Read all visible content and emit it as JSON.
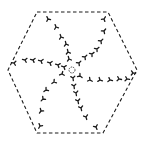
{
  "diagram": {
    "title": "",
    "shape": "hexagon-dashed-outline",
    "hexagon_points": [
      [
        37,
        12
      ],
      [
        108,
        12
      ],
      [
        137,
        70
      ],
      [
        103,
        133
      ],
      [
        37,
        133
      ],
      [
        8,
        70
      ]
    ],
    "stroke_color": "#1a1a1a",
    "background": "#ffffff",
    "center": {
      "x": 72,
      "y": 70,
      "r": 3,
      "icon": "circle-icon"
    },
    "arms": [
      {
        "name": "arm-upper-left",
        "marks": [
          [
            48,
            19
          ],
          [
            56,
            27
          ],
          [
            61,
            37
          ],
          [
            66,
            44
          ],
          [
            68,
            52
          ],
          [
            69,
            59
          ]
        ]
      },
      {
        "name": "arm-upper-right",
        "marks": [
          [
            104,
            19
          ],
          [
            104,
            31
          ],
          [
            101,
            41
          ],
          [
            97,
            49
          ],
          [
            92,
            54
          ],
          [
            85,
            57
          ],
          [
            79,
            63
          ]
        ]
      },
      {
        "name": "arm-left",
        "marks": [
          [
            14,
            63
          ],
          [
            25,
            60
          ],
          [
            33,
            60
          ],
          [
            41,
            61
          ],
          [
            50,
            63
          ],
          [
            58,
            65
          ],
          [
            64,
            67
          ]
        ]
      },
      {
        "name": "arm-right",
        "marks": [
          [
            80,
            76
          ],
          [
            90,
            80
          ],
          [
            100,
            80
          ],
          [
            110,
            80
          ],
          [
            119,
            79
          ],
          [
            127,
            79
          ],
          [
            133,
            73
          ]
        ]
      },
      {
        "name": "arm-lower-left",
        "marks": [
          [
            62,
            74
          ],
          [
            54,
            82
          ],
          [
            46,
            90
          ],
          [
            43,
            99
          ],
          [
            41,
            111
          ],
          [
            40,
            126
          ]
        ]
      },
      {
        "name": "arm-lower-right",
        "marks": [
          [
            73,
            78
          ],
          [
            74,
            86
          ],
          [
            76,
            93
          ],
          [
            78,
            101
          ],
          [
            81,
            108
          ],
          [
            86,
            117
          ],
          [
            96,
            127
          ]
        ]
      }
    ]
  }
}
